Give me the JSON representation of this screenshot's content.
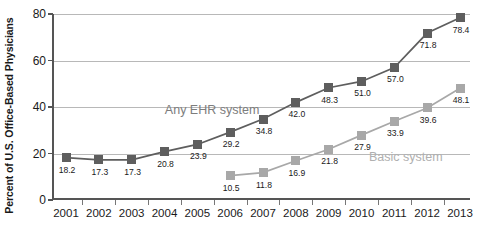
{
  "chart_data": {
    "type": "line",
    "title": "",
    "xlabel": "",
    "ylabel": "Percent of U.S. Office-Based Physicians",
    "categories": [
      "2001",
      "2002",
      "2003",
      "2004",
      "2005",
      "2006",
      "2007",
      "2008",
      "2009",
      "2010",
      "2011",
      "2012",
      "2013"
    ],
    "ylim": [
      0,
      80
    ],
    "yticks": [
      0,
      20,
      40,
      60,
      80
    ],
    "grid": true,
    "legend_position": "inline-annotation",
    "series": [
      {
        "name": "Any EHR system",
        "color": "#5e5e5e",
        "marker": "square",
        "values": [
          18.2,
          17.3,
          17.3,
          20.8,
          23.9,
          29.2,
          34.8,
          42.0,
          48.3,
          51.0,
          57.0,
          71.8,
          78.4
        ],
        "labels": [
          "18.2",
          "17.3",
          "17.3",
          "20.8",
          "23.9",
          "29.2",
          "34.8",
          "42.0",
          "48.3",
          "51.0",
          "57.0",
          "71.8",
          "78.4"
        ]
      },
      {
        "name": "Basic system",
        "color": "#a8a8a8",
        "marker": "square",
        "x": [
          "2006",
          "2007",
          "2008",
          "2009",
          "2010",
          "2011",
          "2012",
          "2013"
        ],
        "values": [
          10.5,
          11.8,
          16.9,
          21.8,
          27.9,
          33.9,
          39.6,
          48.1
        ],
        "labels": [
          "10.5",
          "11.8",
          "16.9",
          "21.8",
          "27.9",
          "33.9",
          "39.6",
          "48.1"
        ]
      }
    ],
    "annotations": [
      {
        "text": "Any EHR system",
        "series": "Any EHR system"
      },
      {
        "text": "Basic system",
        "series": "Basic system"
      }
    ]
  },
  "axis": {
    "y_title": "Percent of U.S. Office-Based Physicians",
    "y_tick_labels": [
      "0",
      "20",
      "40",
      "60",
      "80"
    ],
    "x_tick_labels": [
      "2001",
      "2002",
      "2003",
      "2004",
      "2005",
      "2006",
      "2007",
      "2008",
      "2009",
      "2010",
      "2011",
      "2012",
      "2013"
    ]
  },
  "annotations": {
    "any_ehr": "Any EHR system",
    "basic": "Basic system"
  },
  "colors": {
    "any_ehr": "#5e5e5e",
    "basic": "#a8a8a8",
    "grid": "#b8b8b8",
    "axis": "#555555",
    "text": "#1a1a1a"
  }
}
